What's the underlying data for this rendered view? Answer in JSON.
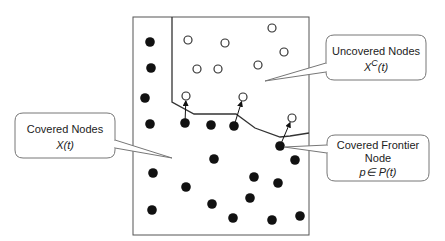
{
  "diagram": {
    "colors": {
      "stroke": "#333333",
      "filled_node": "#111111",
      "open_node_fill": "#ffffff",
      "callout_border": "#777777"
    },
    "frame": {
      "x": 133,
      "y": 17,
      "w": 176,
      "h": 218
    },
    "frontier_line": [
      [
        172,
        17
      ],
      [
        172,
        102
      ],
      [
        194,
        114
      ],
      [
        236,
        114
      ],
      [
        255,
        128
      ],
      [
        280,
        137
      ],
      [
        290,
        136
      ],
      [
        309,
        133
      ]
    ],
    "covered_nodes": [
      [
        150,
        42
      ],
      [
        151,
        68
      ],
      [
        145,
        98
      ],
      [
        150,
        124
      ],
      [
        185,
        123
      ],
      [
        211,
        125
      ],
      [
        234,
        126
      ],
      [
        280,
        146
      ],
      [
        295,
        160
      ],
      [
        214,
        159
      ],
      [
        153,
        173
      ],
      [
        254,
        177
      ],
      [
        278,
        183
      ],
      [
        186,
        187
      ],
      [
        250,
        198
      ],
      [
        212,
        204
      ],
      [
        152,
        210
      ],
      [
        233,
        218
      ],
      [
        272,
        220
      ],
      [
        300,
        216
      ]
    ],
    "uncovered_nodes": [
      [
        272,
        28
      ],
      [
        188,
        40
      ],
      [
        225,
        43
      ],
      [
        284,
        52
      ],
      [
        197,
        69
      ],
      [
        218,
        69
      ],
      [
        258,
        65
      ],
      [
        186,
        96
      ],
      [
        243,
        97
      ],
      [
        292,
        118
      ]
    ],
    "arrows": [
      {
        "from": [
          185,
          123
        ],
        "to": [
          186,
          96
        ]
      },
      {
        "from": [
          234,
          126
        ],
        "to": [
          243,
          97
        ]
      },
      {
        "from": [
          280,
          146
        ],
        "to": [
          292,
          118
        ]
      }
    ],
    "callouts": {
      "uncovered": {
        "line1": "Uncovered Nodes",
        "math_base": "X",
        "math_sup": "C",
        "math_rest": "(t)"
      },
      "covered": {
        "line1": "Covered Nodes",
        "line2": "X(t)"
      },
      "frontier": {
        "line1": "Covered Frontier",
        "line2": "Node",
        "line3": "p∈ P(t)"
      }
    }
  }
}
